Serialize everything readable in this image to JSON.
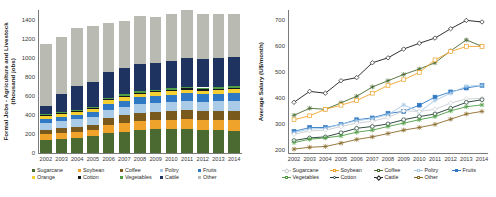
{
  "figure": {
    "panels": [
      "left-bar-chart",
      "right-line-chart"
    ]
  },
  "left": {
    "ylabel": "Formal Jobs - Agriculture and Livestock\n(thousand jobs)",
    "legend_labels": [
      "Sugarcane",
      "Soybean",
      "Coffee",
      "Poltry",
      "Fruits",
      "Orange",
      "Cotton",
      "Vegetables",
      "Cattle",
      "Other"
    ]
  },
  "right": {
    "ylabel": "Average Salary (U$/month)",
    "legend_labels": [
      "Sugarcane",
      "Soybean",
      "Coffee",
      "Poltry",
      "Fruits",
      "Vegetables",
      "Cotton",
      "Cattle",
      "Other"
    ]
  },
  "chart_data": [
    {
      "type": "bar",
      "id": "formal-jobs-stacked-bar",
      "title": "",
      "stacked": true,
      "xlabel": "",
      "ylabel": "Formal Jobs - Agriculture and Livestock (thousand jobs)",
      "categories": [
        "2002",
        "2003",
        "2004",
        "2005",
        "2006",
        "2007",
        "2008",
        "2009",
        "2010",
        "2011",
        "2012",
        "2013",
        "2014"
      ],
      "ylim": [
        0,
        1500
      ],
      "yticks": [
        0,
        200,
        400,
        600,
        800,
        1000,
        1200,
        1400
      ],
      "grid": false,
      "legend_position": "bottom",
      "series": [
        {
          "name": "Sugarcane",
          "color": "#4a6a31",
          "values": [
            140,
            150,
            160,
            175,
            210,
            225,
            245,
            250,
            250,
            255,
            245,
            240,
            235
          ]
        },
        {
          "name": "Soybean",
          "color": "#f0a32a",
          "values": [
            55,
            58,
            62,
            65,
            80,
            85,
            90,
            92,
            95,
            100,
            100,
            105,
            108
          ]
        },
        {
          "name": "Coffee",
          "color": "#7a5a1c",
          "values": [
            50,
            52,
            55,
            58,
            80,
            85,
            88,
            90,
            92,
            95,
            95,
            98,
            100
          ]
        },
        {
          "name": "Poltry",
          "color": "#a9cbe8",
          "values": [
            70,
            72,
            75,
            78,
            85,
            90,
            92,
            95,
            98,
            100,
            100,
            102,
            104
          ]
        },
        {
          "name": "Fruits",
          "color": "#2f78c4",
          "values": [
            45,
            48,
            50,
            52,
            62,
            65,
            68,
            70,
            72,
            75,
            75,
            78,
            80
          ]
        },
        {
          "name": "Orange",
          "color": "#f5d033",
          "values": [
            28,
            29,
            30,
            31,
            35,
            36,
            37,
            38,
            39,
            40,
            40,
            41,
            42
          ]
        },
        {
          "name": "Cotton",
          "color": "#14181c",
          "values": [
            8,
            8,
            9,
            9,
            10,
            10,
            11,
            11,
            11,
            12,
            12,
            12,
            12
          ]
        },
        {
          "name": "Vegetables",
          "color": "#4f9d45",
          "values": [
            14,
            15,
            15,
            16,
            18,
            18,
            19,
            19,
            20,
            20,
            20,
            21,
            21
          ]
        },
        {
          "name": "Cattle",
          "color": "#1f3360",
          "values": [
            80,
            190,
            250,
            260,
            270,
            275,
            285,
            280,
            285,
            295,
            300,
            300,
            305
          ]
        },
        {
          "name": "Other",
          "color": "#b9bab2",
          "values": [
            650,
            590,
            605,
            585,
            510,
            500,
            500,
            480,
            495,
            510,
            475,
            465,
            455
          ]
        }
      ]
    },
    {
      "type": "line",
      "id": "average-salary-lines",
      "title": "",
      "xlabel": "",
      "ylabel": "Average Salary (U$/month)",
      "categories": [
        "2002",
        "2003",
        "2004",
        "2005",
        "2006",
        "2007",
        "2008",
        "2009",
        "2010",
        "2011",
        "2012",
        "2013",
        "2014"
      ],
      "ylim": [
        190,
        740
      ],
      "yticks": [
        200,
        300,
        400,
        500,
        600,
        700
      ],
      "grid": false,
      "legend_position": "bottom",
      "series": [
        {
          "name": "Cattle",
          "color": "#1a1a1a",
          "marker": "diamond-open",
          "values": [
            385,
            427,
            420,
            468,
            480,
            537,
            556,
            590,
            612,
            632,
            668,
            700,
            694
          ]
        },
        {
          "name": "Coffee",
          "color": "#4a6a31",
          "marker": "star",
          "values": [
            335,
            362,
            358,
            383,
            408,
            444,
            468,
            492,
            513,
            537,
            583,
            625,
            600
          ]
        },
        {
          "name": "Soybean",
          "color": "#f0a32a",
          "marker": "square-open",
          "values": [
            318,
            333,
            358,
            374,
            392,
            420,
            450,
            472,
            500,
            548,
            580,
            600,
            600
          ]
        },
        {
          "name": "Fruits",
          "color": "#2f78c4",
          "marker": "square-fill",
          "values": [
            273,
            288,
            288,
            300,
            318,
            325,
            342,
            350,
            374,
            405,
            425,
            440,
            450
          ]
        },
        {
          "name": "Poltry",
          "color": "#a9cbe8",
          "marker": "plus",
          "values": [
            268,
            282,
            285,
            300,
            314,
            322,
            337,
            375,
            348,
            392,
            420,
            447,
            450
          ]
        },
        {
          "name": "Sugarcane",
          "color": "#c8cdd2",
          "marker": "diamond-open",
          "values": [
            262,
            275,
            278,
            292,
            305,
            312,
            327,
            352,
            350,
            358,
            382,
            398,
            400
          ]
        },
        {
          "name": "Cotton",
          "color": "#1d3a2e",
          "marker": "circle-open",
          "values": [
            238,
            248,
            252,
            268,
            285,
            292,
            302,
            318,
            330,
            340,
            362,
            385,
            395
          ]
        },
        {
          "name": "Vegetables",
          "color": "#4f9d45",
          "marker": "plus",
          "values": [
            230,
            243,
            248,
            256,
            270,
            278,
            292,
            305,
            318,
            330,
            352,
            368,
            375
          ]
        },
        {
          "name": "Other",
          "color": "#8a6a2a",
          "marker": "plus",
          "values": [
            205,
            212,
            215,
            228,
            242,
            252,
            265,
            278,
            288,
            300,
            320,
            340,
            350
          ]
        }
      ]
    }
  ]
}
